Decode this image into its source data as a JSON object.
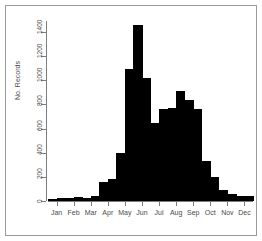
{
  "figure": {
    "frame_color": "#9a9a9a",
    "background": "#ffffff",
    "bar_color": "#000000",
    "axis_color": "#7d7d7d",
    "text_color": "#4a4a4a"
  },
  "chart_data": {
    "type": "bar",
    "title": "",
    "xlabel": "",
    "ylabel": "No. Records",
    "ylim": [
      0,
      1500
    ],
    "yticks": [
      0,
      200,
      400,
      600,
      800,
      1000,
      1200,
      1400
    ],
    "ytick_labels": [
      "0",
      "200",
      "400",
      "600",
      "800",
      "1000",
      "1200",
      "1400"
    ],
    "grid": false,
    "legend": false,
    "xtick_labels": [
      "Jan",
      "Feb",
      "Mar",
      "Apr",
      "May",
      "Jun",
      "Jul",
      "Aug",
      "Sep",
      "Oct",
      "Nov",
      "Dec"
    ],
    "categories": [
      "Jan-1",
      "Jan-2",
      "Feb-1",
      "Feb-2",
      "Mar-1",
      "Mar-2",
      "Apr-1",
      "Apr-2",
      "May-1",
      "May-2",
      "Jun-1",
      "Jun-2",
      "Jul-1",
      "Jul-2",
      "Aug-1",
      "Aug-2",
      "Sep-1",
      "Sep-2",
      "Oct-1",
      "Oct-2",
      "Nov-1",
      "Nov-2",
      "Dec-1",
      "Dec-2"
    ],
    "values": [
      20,
      22,
      24,
      30,
      26,
      40,
      160,
      185,
      400,
      1095,
      1460,
      1020,
      645,
      760,
      770,
      910,
      840,
      760,
      330,
      200,
      95,
      60,
      45,
      40
    ]
  }
}
